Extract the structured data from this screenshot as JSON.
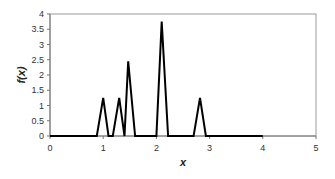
{
  "chart_data": {
    "type": "line",
    "title": "",
    "xlabel": "x",
    "ylabel": "f(x)",
    "xlim": [
      0,
      5
    ],
    "ylim": [
      0,
      4
    ],
    "xticks": [
      "0",
      "1",
      "2",
      "3",
      "4",
      "5"
    ],
    "yticks": [
      "0",
      "0.5",
      "1",
      "1.5",
      "2",
      "2.5",
      "3",
      "3.5",
      "4"
    ],
    "grid": false,
    "legend": null,
    "series": [
      {
        "name": "f(x)",
        "color": "#000000",
        "x": [
          0,
          0.88,
          1.0,
          1.1,
          1.18,
          1.3,
          1.4,
          1.47,
          1.6,
          2.0,
          2.1,
          2.22,
          2.7,
          2.82,
          2.93,
          4.0
        ],
        "y": [
          0,
          0,
          1.25,
          0,
          0,
          1.25,
          0,
          2.45,
          0,
          0,
          3.75,
          0,
          0,
          1.25,
          0,
          0
        ]
      }
    ]
  }
}
